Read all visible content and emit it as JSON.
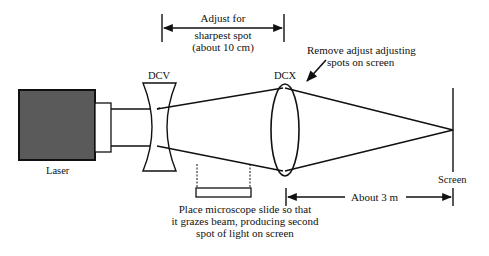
{
  "diagram": {
    "components": {
      "laser": {
        "label": "Laser"
      },
      "dcv_lens": {
        "label": "DCV"
      },
      "dcx_lens": {
        "label": "DCX"
      },
      "screen": {
        "label": "Screen"
      },
      "microscope_slide": {
        "label": ""
      }
    },
    "annotations": {
      "adjust_spacing": {
        "line1": "Adjust for",
        "line2": "sharpest spot",
        "line3": "(about 10 cm)"
      },
      "remove_adjust": {
        "line1": "Remove adjust adjusting",
        "line2": "spots on screen"
      },
      "slide_instruction": {
        "line1": "Place microscope slide so that",
        "line2": "it grazes beam, producing second",
        "line3": "spot of light on screen"
      },
      "distance_to_screen": {
        "label": "About 3 m"
      }
    },
    "colors": {
      "ink": "#111111",
      "laser_fill": "#5a5a5a",
      "background": "#ffffff"
    }
  }
}
